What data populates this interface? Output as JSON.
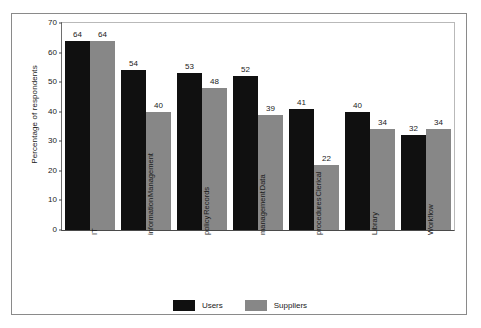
{
  "chart_data": {
    "type": "bar",
    "title": "",
    "subtitle": "",
    "xlabel": "",
    "ylabel": "Percentage of respondents",
    "ylim": [
      0,
      70
    ],
    "ytick_step": 10,
    "yticks": [
      "70",
      "60",
      "50",
      "40",
      "30",
      "20",
      "10",
      "0"
    ],
    "grid": false,
    "legend_position": "bottom-center",
    "categories": [
      "IT",
      "Management information",
      "Records policy",
      "Data management",
      "Clerical procedures",
      "Library",
      "Workflow"
    ],
    "category_lines": [
      [
        "IT"
      ],
      [
        "Management",
        "information"
      ],
      [
        "Records",
        "policy"
      ],
      [
        "Data",
        "management"
      ],
      [
        "Clerical",
        "procedures"
      ],
      [
        "Library"
      ],
      [
        "Workflow"
      ]
    ],
    "series": [
      {
        "name": "Users",
        "color": "#101010",
        "values": [
          64,
          54,
          53,
          52,
          41,
          40,
          32
        ]
      },
      {
        "name": "Suppliers",
        "color": "#878787",
        "values": [
          64,
          40,
          48,
          39,
          22,
          34,
          34
        ]
      }
    ]
  },
  "legend": {
    "items": [
      {
        "label": "Users",
        "color": "#101010"
      },
      {
        "label": "Suppliers",
        "color": "#878787"
      }
    ]
  },
  "axis": {
    "y_label": "Percentage of respondents"
  },
  "colors": {
    "users_bar": "#101010",
    "suppliers_bar": "#878787",
    "frame": "#8a8a8a",
    "plot_border": "#b9b9b9",
    "axis_line": "#4a4a4a",
    "background": "#ffffff",
    "text": "#1a1a1a"
  }
}
